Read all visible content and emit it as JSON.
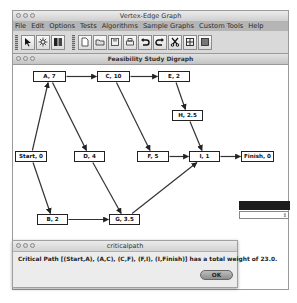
{
  "window": {
    "title": "Vertex-Edge Graph",
    "menu": [
      "File",
      "Edit",
      "Options",
      "Tests",
      "Algorithms",
      "Sample Graphs",
      "Custom Tools",
      "Help"
    ]
  },
  "toolbar": {
    "mode_tools": [
      {
        "name": "select-pointer-icon",
        "glyph": "pointer"
      },
      {
        "name": "vertex-tool-icon",
        "glyph": "vertex"
      },
      {
        "name": "edge-tool-icon",
        "glyph": "edge"
      }
    ],
    "file_tools": [
      {
        "name": "new-document-icon"
      },
      {
        "name": "open-folder-icon"
      },
      {
        "name": "save-disk-icon"
      },
      {
        "name": "print-icon"
      },
      {
        "name": "undo-icon"
      },
      {
        "name": "redo-icon"
      },
      {
        "name": "cut-scissors-icon"
      },
      {
        "name": "grid-icon"
      },
      {
        "name": "background-image-icon"
      }
    ]
  },
  "graph_window": {
    "title": "Feasibility Study Digraph",
    "nodes": [
      {
        "id": "A",
        "label": "A, 7",
        "x": 20,
        "y": 6,
        "w": 33
      },
      {
        "id": "C",
        "label": "C, 10",
        "x": 84,
        "y": 6,
        "w": 33
      },
      {
        "id": "E",
        "label": "E, 2",
        "x": 145,
        "y": 6,
        "w": 32
      },
      {
        "id": "H",
        "label": "H, 2.5",
        "x": 159,
        "y": 45,
        "w": 31
      },
      {
        "id": "Start",
        "label": "Start, 0",
        "x": 2,
        "y": 86,
        "w": 32
      },
      {
        "id": "D",
        "label": "D, 4",
        "x": 61,
        "y": 86,
        "w": 31
      },
      {
        "id": "F",
        "label": "F, 5",
        "x": 124,
        "y": 86,
        "w": 32
      },
      {
        "id": "I",
        "label": "I, 1",
        "x": 176,
        "y": 86,
        "w": 31
      },
      {
        "id": "Finish",
        "label": "Finish, 0",
        "x": 228,
        "y": 86,
        "w": 33
      },
      {
        "id": "B",
        "label": "B, 2",
        "x": 24,
        "y": 149,
        "w": 31
      },
      {
        "id": "G",
        "label": "G, 3.5",
        "x": 96,
        "y": 149,
        "w": 31
      }
    ],
    "edges": [
      [
        "Start",
        "A"
      ],
      [
        "Start",
        "B"
      ],
      [
        "A",
        "C"
      ],
      [
        "A",
        "D"
      ],
      [
        "C",
        "E"
      ],
      [
        "C",
        "F"
      ],
      [
        "E",
        "H"
      ],
      [
        "H",
        "I"
      ],
      [
        "F",
        "I"
      ],
      [
        "I",
        "Finish"
      ],
      [
        "D",
        "G"
      ],
      [
        "B",
        "G"
      ],
      [
        "G",
        "I"
      ]
    ]
  },
  "dialog": {
    "title": "criticalpath",
    "message": "Critical Path [(Start,A), (A,C), (C,F), (F,I), (I,Finish)] has a total weight of 23.0.",
    "ok_label": "OK"
  }
}
